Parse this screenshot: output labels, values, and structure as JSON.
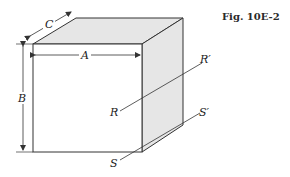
{
  "figure": {
    "caption": "Fig. 10E-2",
    "labels": {
      "A": "A",
      "B": "B",
      "C": "C",
      "R": "R",
      "R_prime": "R′",
      "S": "S",
      "S_prime": "S′"
    },
    "colors": {
      "line": "#333333",
      "shade": "#e6e6e6",
      "background": "#ffffff"
    }
  }
}
